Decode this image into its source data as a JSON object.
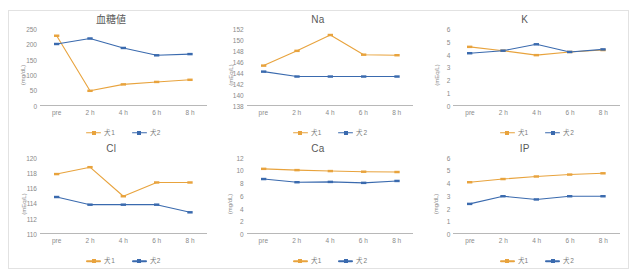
{
  "figure": {
    "series_names": {
      "s1": "犬1",
      "s2": "犬2"
    },
    "colors": {
      "series1": "#E8A33D",
      "series2": "#3A6AAE",
      "axis": "#b8b8b8",
      "text": "#8a8a8a",
      "frame": "#e2e2e2"
    },
    "categories": [
      "pre",
      "2 h",
      "4 h",
      "6 h",
      "8 h"
    ]
  },
  "chart_data": [
    {
      "type": "line",
      "title": "血糖値",
      "xlabel": "",
      "ylabel": "(mg/dL)",
      "categories": [
        "pre",
        "2 h",
        "4 h",
        "6 h",
        "8 h"
      ],
      "ylim": [
        0,
        250
      ],
      "yticks": [
        0,
        50,
        100,
        150,
        200,
        250
      ],
      "grid": false,
      "legend_position": "bottom",
      "series": [
        {
          "name": "犬1",
          "values": [
            228,
            48,
            69,
            77,
            84
          ]
        },
        {
          "name": "犬2",
          "values": [
            201,
            219,
            188,
            164,
            168
          ]
        }
      ]
    },
    {
      "type": "line",
      "title": "Na",
      "xlabel": "",
      "ylabel": "(mEq/L)",
      "categories": [
        "pre",
        "2 h",
        "4 h",
        "6 h",
        "8 h"
      ],
      "ylim": [
        138,
        152
      ],
      "yticks": [
        138,
        140,
        142,
        144,
        146,
        148,
        150,
        152
      ],
      "grid": false,
      "legend_position": "bottom",
      "series": [
        {
          "name": "犬1",
          "values": [
            145.3,
            148.0,
            150.9,
            147.3,
            147.2
          ]
        },
        {
          "name": "犬2",
          "values": [
            144.2,
            143.3,
            143.3,
            143.3,
            143.3
          ]
        }
      ]
    },
    {
      "type": "line",
      "title": "K",
      "xlabel": "",
      "ylabel": "(mEq/L)",
      "categories": [
        "pre",
        "2 h",
        "4 h",
        "6 h",
        "8 h"
      ],
      "ylim": [
        0,
        6
      ],
      "yticks": [
        0,
        1,
        2,
        3,
        4,
        5,
        6
      ],
      "grid": false,
      "legend_position": "bottom",
      "series": [
        {
          "name": "犬1",
          "values": [
            4.6,
            4.3,
            3.95,
            4.2,
            4.35
          ]
        },
        {
          "name": "犬2",
          "values": [
            4.1,
            4.3,
            4.8,
            4.2,
            4.4
          ]
        }
      ]
    },
    {
      "type": "line",
      "title": "Cl",
      "xlabel": "",
      "ylabel": "(mEq/L)",
      "categories": [
        "pre",
        "2 h",
        "4 h",
        "6 h",
        "8 h"
      ],
      "ylim": [
        110,
        120
      ],
      "yticks": [
        110,
        112,
        114,
        116,
        118,
        120
      ],
      "grid": false,
      "legend_position": "bottom",
      "series": [
        {
          "name": "犬1",
          "values": [
            117.9,
            118.8,
            115.0,
            116.8,
            116.8
          ]
        },
        {
          "name": "犬2",
          "values": [
            114.9,
            113.9,
            113.9,
            113.9,
            112.9
          ]
        }
      ]
    },
    {
      "type": "line",
      "title": "Ca",
      "xlabel": "",
      "ylabel": "(mg/dL)",
      "categories": [
        "pre",
        "2 h",
        "4 h",
        "6 h",
        "8 h"
      ],
      "ylim": [
        0,
        12
      ],
      "yticks": [
        0,
        2,
        4,
        6,
        8,
        10,
        12
      ],
      "grid": false,
      "legend_position": "bottom",
      "series": [
        {
          "name": "犬1",
          "values": [
            10.3,
            10.1,
            9.95,
            9.85,
            9.8
          ]
        },
        {
          "name": "犬2",
          "values": [
            8.7,
            8.2,
            8.25,
            8.1,
            8.4
          ]
        }
      ]
    },
    {
      "type": "line",
      "title": "IP",
      "xlabel": "",
      "ylabel": "(mg/dL)",
      "categories": [
        "pre",
        "2 h",
        "4 h",
        "6 h",
        "8 h"
      ],
      "ylim": [
        0,
        6
      ],
      "yticks": [
        0,
        1,
        2,
        3,
        4,
        5,
        6
      ],
      "grid": false,
      "legend_position": "bottom",
      "series": [
        {
          "name": "犬1",
          "values": [
            4.1,
            4.35,
            4.55,
            4.7,
            4.8
          ]
        },
        {
          "name": "犬2",
          "values": [
            2.4,
            3.0,
            2.75,
            3.0,
            3.0
          ]
        }
      ]
    }
  ]
}
